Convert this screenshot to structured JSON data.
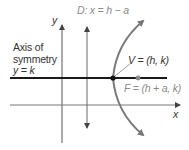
{
  "diagram": {
    "type": "parabola-horizontal-axis",
    "labels": {
      "y_axis": "y",
      "x_axis": "x",
      "directrix": "D: x = h − a",
      "vertex": "V = (h, k)",
      "focus": "F = (h + a, k)",
      "axis_of_symmetry_line1": "Axis of",
      "axis_of_symmetry_line2": "symmetry",
      "axis_of_symmetry_line3": "y = k"
    },
    "colors": {
      "axis_of_symmetry": "#1a1a1a",
      "axes": "#555555",
      "curve": "#7a7a7a",
      "directrix": "#666666",
      "vertex_dot": "#111111",
      "focus_dot": "#8a8a8a",
      "label_dark": "#333333",
      "label_grey": "#8a8a8a"
    }
  }
}
